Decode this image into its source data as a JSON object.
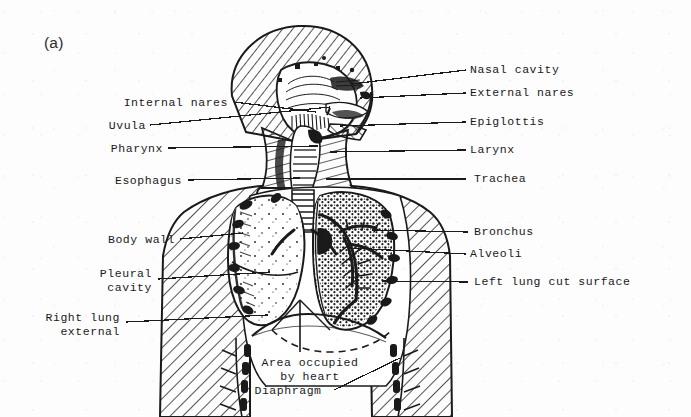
{
  "figure": {
    "panel_letter": "(a)",
    "caption_note": "",
    "background_color": "#fdfdfd",
    "ink_color": "#1a1a1a"
  },
  "labels_left": [
    {
      "id": "internal-nares",
      "text": "Internal nares",
      "x": 228,
      "y": 106,
      "leader": [
        [
          234,
          102
        ],
        [
          316,
          112
        ]
      ]
    },
    {
      "id": "uvula",
      "text": "Uvula",
      "x": 146,
      "y": 129,
      "leader": [
        [
          150,
          125
        ],
        [
          330,
          107
        ]
      ]
    },
    {
      "id": "pharynx",
      "text": "Pharynx",
      "x": 163,
      "y": 152,
      "leader": [
        [
          168,
          148
        ],
        [
          318,
          146
        ]
      ]
    },
    {
      "id": "esophagus",
      "text": "Esophagus",
      "x": 182,
      "y": 184,
      "leader": [
        [
          188,
          180
        ],
        [
          300,
          178
        ]
      ]
    },
    {
      "id": "body-wall",
      "text": "Body wall",
      "x": 175,
      "y": 243,
      "leader": [
        [
          180,
          239
        ],
        [
          243,
          233
        ]
      ]
    },
    {
      "id": "pleural-cavity",
      "text": "Pleural\ncavity",
      "x": 152,
      "y": 277,
      "leader": [
        [
          158,
          279
        ],
        [
          270,
          272
        ]
      ]
    },
    {
      "id": "right-lung-external",
      "text": "Right lung\nexternal",
      "x": 120,
      "y": 321,
      "leader": [
        [
          126,
          322
        ],
        [
          268,
          315
        ]
      ]
    }
  ],
  "labels_right": [
    {
      "id": "nasal-cavity",
      "text": "Nasal cavity",
      "x": 470,
      "y": 73,
      "leader": [
        [
          466,
          70
        ],
        [
          352,
          84
        ]
      ]
    },
    {
      "id": "external-nares",
      "text": "External nares",
      "x": 470,
      "y": 96,
      "leader": [
        [
          466,
          93
        ],
        [
          360,
          98
        ]
      ]
    },
    {
      "id": "epiglottis",
      "text": "Epiglottis",
      "x": 470,
      "y": 125,
      "leader": [
        [
          466,
          122
        ],
        [
          340,
          126
        ]
      ]
    },
    {
      "id": "larynx",
      "text": "Larynx",
      "x": 470,
      "y": 153,
      "leader": [
        [
          466,
          150
        ],
        [
          330,
          152
        ]
      ]
    },
    {
      "id": "trachea",
      "text": "Trachea",
      "x": 474,
      "y": 182,
      "leader": [
        [
          466,
          179
        ],
        [
          326,
          179
        ]
      ]
    },
    {
      "id": "bronchus",
      "text": "Bronchus",
      "x": 474,
      "y": 235,
      "leader": [
        [
          468,
          232
        ],
        [
          372,
          230
        ]
      ]
    },
    {
      "id": "alveoli",
      "text": "Alveoli",
      "x": 470,
      "y": 257,
      "leader": [
        [
          466,
          254
        ],
        [
          350,
          248
        ]
      ]
    },
    {
      "id": "left-lung-cut-surface",
      "text": "Left lung cut surface",
      "x": 474,
      "y": 285,
      "leader": [
        [
          468,
          282
        ],
        [
          382,
          281
        ]
      ]
    }
  ],
  "labels_bottom": [
    {
      "id": "area-occupied-by-heart",
      "text": "Area occupied\nby heart",
      "x": 310,
      "y": 366,
      "leader": null
    },
    {
      "id": "diaphragm",
      "text": "Diaphragm",
      "x": 288,
      "y": 394,
      "leader": [
        [
          334,
          390
        ],
        [
          400,
          358
        ]
      ]
    }
  ],
  "anatomy_parts": [
    "head-sagittal-section",
    "nasal-cavity-region",
    "oral-cavity-region",
    "neck",
    "shoulders",
    "body-wall-hatched",
    "right-lung-external",
    "left-lung-cut-surface",
    "trachea",
    "bronchial-tree",
    "heart-area-dashed",
    "diaphragm",
    "ribs"
  ]
}
